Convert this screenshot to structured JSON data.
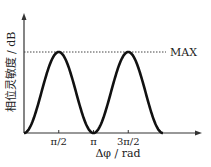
{
  "chart_data": {
    "type": "line",
    "title": "",
    "xlabel": "Δφ / rad",
    "ylabel": "相位灵敏度 / dB",
    "x_ticks": [
      {
        "value": 1.5708,
        "label": "π/2"
      },
      {
        "value": 3.1416,
        "label": "π"
      },
      {
        "value": 4.7124,
        "label": "3π/2"
      }
    ],
    "xlim": [
      0,
      6.9
    ],
    "ylim": [
      0,
      1.38
    ],
    "series": [
      {
        "name": "phase sensitivity",
        "function": "sin^2(x)",
        "x_range": [
          0,
          6.2832
        ],
        "x": [
          0,
          0.7854,
          1.5708,
          2.3562,
          3.1416,
          3.927,
          4.7124,
          5.4978,
          6.2832
        ],
        "y": [
          0,
          0.5,
          1,
          0.5,
          0,
          0.5,
          1,
          0.5,
          0
        ]
      }
    ],
    "annotations": [
      {
        "type": "hline",
        "y": 1,
        "style": "dashed",
        "label": "MAX"
      }
    ],
    "grid": false,
    "legend": "none"
  }
}
